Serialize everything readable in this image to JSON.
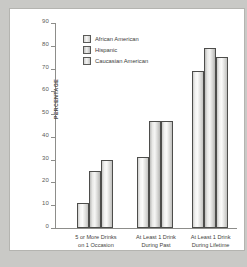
{
  "chart_data": {
    "type": "bar",
    "title": "",
    "xlabel": "",
    "ylabel": "PERCENTAGE",
    "ylim": [
      0,
      90
    ],
    "yticks": [
      0,
      10,
      20,
      30,
      40,
      50,
      60,
      70,
      80,
      90
    ],
    "grid": false,
    "legend_position": "upper-left-inside",
    "categories": [
      "5 or More Drinks\non 1 Occasion\nDuring Past 30 Days",
      "At Least 1 Drink\nDuring Past\n30 Days",
      "At Least 1 Drink\nDuring Lifetime"
    ],
    "category_lines": [
      [
        "5 or More Drinks",
        "on 1 Occasion",
        "During Past 30 Days"
      ],
      [
        "At Least 1 Drink",
        "During Past",
        "30 Days"
      ],
      [
        "At Least 1 Drink",
        "During Lifetime"
      ]
    ],
    "series": [
      {
        "name": "African American",
        "values": [
          11,
          31,
          69
        ]
      },
      {
        "name": "Hispanic",
        "values": [
          25,
          47,
          79
        ]
      },
      {
        "name": "Caucasian American",
        "values": [
          30,
          47,
          75
        ]
      }
    ]
  },
  "legend": {
    "items": [
      {
        "label": "African American"
      },
      {
        "label": "Hispanic"
      },
      {
        "label": "Caucasian American"
      }
    ]
  },
  "axis": {
    "y_label": "PERCENTAGE",
    "y_ticks": [
      "90",
      "80",
      "70",
      "60",
      "50",
      "40",
      "30",
      "20",
      "10",
      "0"
    ]
  },
  "colors": {
    "page_background": "#c9c9c6",
    "panel_background": "#ffffff",
    "panel_border": "#b4b4b0",
    "axis": "#8d8d8a",
    "bar_outline": "#4d4d4b",
    "text": "#3f3f3d"
  }
}
